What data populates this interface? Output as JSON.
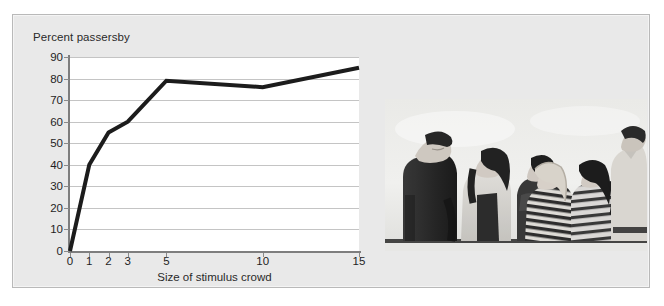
{
  "figure": {
    "panel_bg": "#e9e9e9",
    "plot_bg": "#ffffff",
    "frame_color": "#b9b9b9",
    "series_color": "#1c1c1c",
    "gridline_color": "#c4c4c4",
    "axis_color": "#7e7e7e"
  },
  "chart_data": {
    "type": "line",
    "title": "Percent passersby",
    "xlabel": "Size of stimulus crowd",
    "ylabel": "",
    "x": [
      0,
      1,
      2,
      3,
      5,
      10,
      15
    ],
    "categories": [
      "0",
      "1",
      "2",
      "3",
      "5",
      "10",
      "15"
    ],
    "values": [
      0,
      40,
      55,
      60,
      79,
      76,
      85
    ],
    "series": [
      {
        "name": "Percent passersby",
        "values": [
          0,
          40,
          55,
          60,
          79,
          76,
          85
        ]
      }
    ],
    "ylim": [
      0,
      90
    ],
    "xlim": [
      0,
      15
    ],
    "yticks": [
      0,
      10,
      20,
      30,
      40,
      50,
      60,
      70,
      80,
      90
    ],
    "ytick_labels": [
      "0",
      "10",
      "20",
      "30",
      "40",
      "50",
      "60",
      "70",
      "80",
      "90"
    ],
    "xticks": [
      0,
      1,
      2,
      3,
      5,
      10,
      15
    ],
    "xtick_labels": [
      "0",
      "1",
      "2",
      "3",
      "5",
      "10",
      "15"
    ],
    "grid": "horizontal",
    "legend": "none",
    "line_width": 4
  },
  "photo": {
    "alt": "Black and white photograph of seven people standing in a row outdoors, all looking up at the sky",
    "people_count": 7,
    "palette": {
      "sky": "#f1f1ef",
      "skin": "#d8d2cb",
      "dark": "#2b2b2b",
      "mid": "#8d8d8d",
      "light": "#dcdcda"
    }
  }
}
